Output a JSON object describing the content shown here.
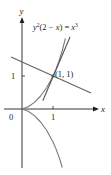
{
  "figure": {
    "equation": {
      "y": "y",
      "exp1": "2",
      "middle": "(2 − ",
      "x": "x",
      "close": ") = ",
      "rhs": "x",
      "exp2": "3"
    },
    "axes": {
      "x_label": "x",
      "y_label": "y",
      "origin_label": "0",
      "x_tick_label": "1",
      "y_tick_label": "1"
    },
    "point_label": "(1, 1)",
    "curve": "cissoid y^2(2 - x) = x^3",
    "lines": [
      "tangent at (1, 1), slope 2",
      "normal at (1, 1), slope -1/2"
    ],
    "colors": {
      "axis": "#231f20",
      "curve": "#7a7a7a",
      "tangent": "#555555",
      "normal": "#666666",
      "text": "#231f20"
    }
  }
}
